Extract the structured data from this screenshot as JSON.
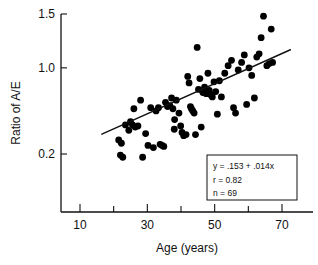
{
  "chart_data": {
    "type": "scatter",
    "title": "",
    "xlabel": "Age (years)",
    "ylabel": "Ratio of A/E",
    "xlim": [
      7,
      77
    ],
    "ylim": [
      0.05,
      1.55
    ],
    "grid": false,
    "legend_position": "none",
    "xticks": [
      10,
      20,
      30,
      40,
      50,
      60,
      70
    ],
    "xtick_labels": [
      "10",
      "",
      "30",
      "",
      "50",
      "",
      "70"
    ],
    "yticks": [
      1.5,
      1.0,
      0.2
    ],
    "ytick_labels": [
      "1.5",
      "1.0",
      "0.2"
    ],
    "annotations": {
      "equation": "y = .153 + .014x",
      "correlation": "r = 0.82",
      "count": "n = 69"
    },
    "fit": {
      "slope": 0.014,
      "intercept": 0.153,
      "r": 0.82,
      "n": 69,
      "x_start": 16.5,
      "x_end": 72.5
    },
    "points": [
      {
        "x": 21.5,
        "y": 0.33
      },
      {
        "x": 22.3,
        "y": 0.3
      },
      {
        "x": 22.0,
        "y": 0.19
      },
      {
        "x": 22.7,
        "y": 0.17
      },
      {
        "x": 23.5,
        "y": 0.47
      },
      {
        "x": 24.5,
        "y": 0.42
      },
      {
        "x": 25.0,
        "y": 0.5
      },
      {
        "x": 25.6,
        "y": 0.47
      },
      {
        "x": 26.4,
        "y": 0.45
      },
      {
        "x": 26.0,
        "y": 0.62
      },
      {
        "x": 27.2,
        "y": 0.46
      },
      {
        "x": 28.0,
        "y": 0.7
      },
      {
        "x": 28.6,
        "y": 0.17
      },
      {
        "x": 29.5,
        "y": 0.39
      },
      {
        "x": 30.2,
        "y": 0.28
      },
      {
        "x": 31.0,
        "y": 0.63
      },
      {
        "x": 31.8,
        "y": 0.26
      },
      {
        "x": 32.6,
        "y": 0.6
      },
      {
        "x": 33.3,
        "y": 0.63
      },
      {
        "x": 33.8,
        "y": 0.29
      },
      {
        "x": 34.4,
        "y": 0.28
      },
      {
        "x": 34.9,
        "y": 0.27
      },
      {
        "x": 35.4,
        "y": 0.68
      },
      {
        "x": 36.0,
        "y": 0.64
      },
      {
        "x": 36.7,
        "y": 0.65
      },
      {
        "x": 37.2,
        "y": 0.72
      },
      {
        "x": 37.6,
        "y": 0.62
      },
      {
        "x": 38.1,
        "y": 0.52
      },
      {
        "x": 38.6,
        "y": 0.7
      },
      {
        "x": 38.0,
        "y": 0.43
      },
      {
        "x": 39.4,
        "y": 0.58
      },
      {
        "x": 39.9,
        "y": 0.46
      },
      {
        "x": 40.3,
        "y": 0.4
      },
      {
        "x": 40.8,
        "y": 0.37
      },
      {
        "x": 41.5,
        "y": 0.38
      },
      {
        "x": 42.0,
        "y": 0.92
      },
      {
        "x": 42.4,
        "y": 0.86
      },
      {
        "x": 42.8,
        "y": 0.64
      },
      {
        "x": 43.1,
        "y": 0.62
      },
      {
        "x": 43.5,
        "y": 0.6
      },
      {
        "x": 43.9,
        "y": 0.58
      },
      {
        "x": 44.3,
        "y": 0.38
      },
      {
        "x": 44.8,
        "y": 1.19
      },
      {
        "x": 45.2,
        "y": 0.8
      },
      {
        "x": 45.6,
        "y": 0.9
      },
      {
        "x": 46.0,
        "y": 0.45
      },
      {
        "x": 46.5,
        "y": 0.77
      },
      {
        "x": 47.0,
        "y": 0.82
      },
      {
        "x": 47.5,
        "y": 0.76
      },
      {
        "x": 48.0,
        "y": 0.95
      },
      {
        "x": 48.4,
        "y": 0.79
      },
      {
        "x": 48.8,
        "y": 0.75
      },
      {
        "x": 49.3,
        "y": 0.73
      },
      {
        "x": 49.8,
        "y": 0.87
      },
      {
        "x": 50.3,
        "y": 0.78
      },
      {
        "x": 50.8,
        "y": 0.57
      },
      {
        "x": 51.4,
        "y": 0.88
      },
      {
        "x": 52.0,
        "y": 0.73
      },
      {
        "x": 53.0,
        "y": 0.95
      },
      {
        "x": 54.0,
        "y": 1.02
      },
      {
        "x": 55.0,
        "y": 1.07
      },
      {
        "x": 55.6,
        "y": 0.63
      },
      {
        "x": 56.2,
        "y": 0.58
      },
      {
        "x": 57.0,
        "y": 0.98
      },
      {
        "x": 58.0,
        "y": 1.05
      },
      {
        "x": 58.8,
        "y": 1.12
      },
      {
        "x": 59.5,
        "y": 0.66
      },
      {
        "x": 60.2,
        "y": 1.0
      },
      {
        "x": 61.0,
        "y": 0.93
      },
      {
        "x": 61.8,
        "y": 0.72
      },
      {
        "x": 62.5,
        "y": 1.1
      },
      {
        "x": 63.2,
        "y": 1.13
      },
      {
        "x": 63.8,
        "y": 1.28
      },
      {
        "x": 64.5,
        "y": 1.48
      },
      {
        "x": 65.5,
        "y": 1.02
      },
      {
        "x": 66.2,
        "y": 1.04
      },
      {
        "x": 66.8,
        "y": 1.36
      },
      {
        "x": 67.2,
        "y": 1.05
      }
    ]
  }
}
